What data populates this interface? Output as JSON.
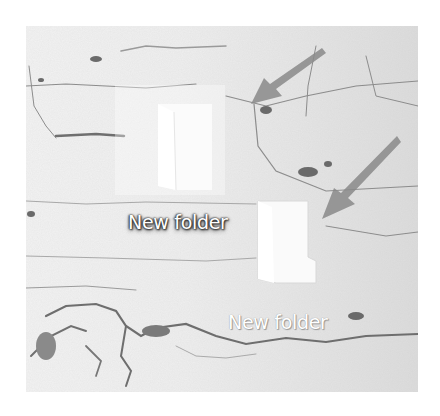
{
  "desktop": {
    "background_color": "#ececec",
    "icons": [
      {
        "label": "New folder",
        "state": "selected",
        "icon": "folder-icon"
      },
      {
        "label": "New folder",
        "state": "normal",
        "icon": "folder-icon"
      }
    ],
    "annotations": [
      {
        "type": "arrow",
        "icon": "arrow-down-left-icon",
        "color": "#8a8a8a"
      },
      {
        "type": "arrow",
        "icon": "arrow-down-left-icon",
        "color": "#8a8a8a"
      }
    ]
  }
}
